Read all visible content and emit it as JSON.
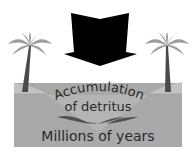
{
  "diagram": {
    "labels": {
      "accumulation": "Accumulation",
      "detritus": "of detritus",
      "time": "Millions of years"
    },
    "icons": {
      "arrow": "down-arrow-icon",
      "left_tree": "palm-tree-icon",
      "right_tree": "palm-tree-icon",
      "detritus": "leaf-layers-icon"
    },
    "colors": {
      "background": "#ffffff",
      "ground": "#a9a9a9",
      "ground_light": "#bdbdbd",
      "hill": "#9a9a9a",
      "palm_leaves": "#9c9c9c",
      "palm_trunk": "#4a4a4a",
      "arrow": "#000000",
      "detritus": "#505050",
      "text": "#2a2a2a"
    }
  }
}
